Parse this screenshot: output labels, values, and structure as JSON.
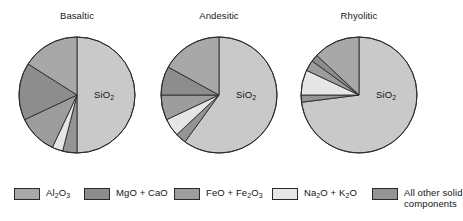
{
  "figure": {
    "caption_present": false,
    "background": "#ffffff"
  },
  "colors": {
    "sio2": "#c9c9c9",
    "al2o3": "#a8a8a8",
    "mgo_cao": "#8d8d8d",
    "feo_fe2o3": "#9d9d9d",
    "na2o_k2o": "#e6e6e6",
    "other": "#949494",
    "outline": "#2a2a2a"
  },
  "charts": [
    {
      "title": "Basaltic",
      "center_label": "SiO",
      "center_label_sub": "2"
    },
    {
      "title": "Andesitic",
      "center_label": "SiO",
      "center_label_sub": "2"
    },
    {
      "title": "Rhyolitic",
      "center_label": "SiO",
      "center_label_sub": "2"
    }
  ],
  "legend": {
    "items": [
      {
        "key": "al2o3",
        "text": "Al",
        "sub1": "2",
        "mid": "O",
        "sub2": "3",
        "tail": "",
        "line2": ""
      },
      {
        "key": "mgo_cao",
        "text": "MgO + CaO",
        "line2": ""
      },
      {
        "key": "feo_fe2o3",
        "text": "FeO + Fe",
        "sub1": "2",
        "mid": "O",
        "sub2": "3",
        "line2": ""
      },
      {
        "key": "na2o_k2o",
        "text": "Na",
        "sub1": "2",
        "mid": "O + K",
        "sub2": "2",
        "tail": "O",
        "line2": ""
      },
      {
        "key": "other",
        "text": "All other solid",
        "line2": "components"
      }
    ]
  },
  "chart_data": {
    "type": "pie",
    "subtitle": "",
    "xlabel": "",
    "ylabel": "",
    "units": "weight percent",
    "legend_position": "bottom",
    "grid": false,
    "categories": [
      "SiO2",
      "Al2O3",
      "MgO + CaO",
      "FeO + Fe2O3",
      "Na2O + K2O",
      "All other solid components"
    ],
    "series": [
      {
        "name": "Basaltic",
        "values": [
          50,
          16,
          16,
          11,
          3,
          4
        ]
      },
      {
        "name": "Andesitic",
        "values": [
          60,
          17,
          8,
          7,
          5,
          3
        ]
      },
      {
        "name": "Rhyolitic",
        "values": [
          73,
          13,
          2,
          3,
          7,
          2
        ]
      }
    ]
  },
  "geometry": {
    "radius": 58,
    "centers": [
      {
        "cx": 77,
        "cy": 95
      },
      {
        "cx": 219,
        "cy": 95
      },
      {
        "cx": 359,
        "cy": 95
      }
    ]
  }
}
